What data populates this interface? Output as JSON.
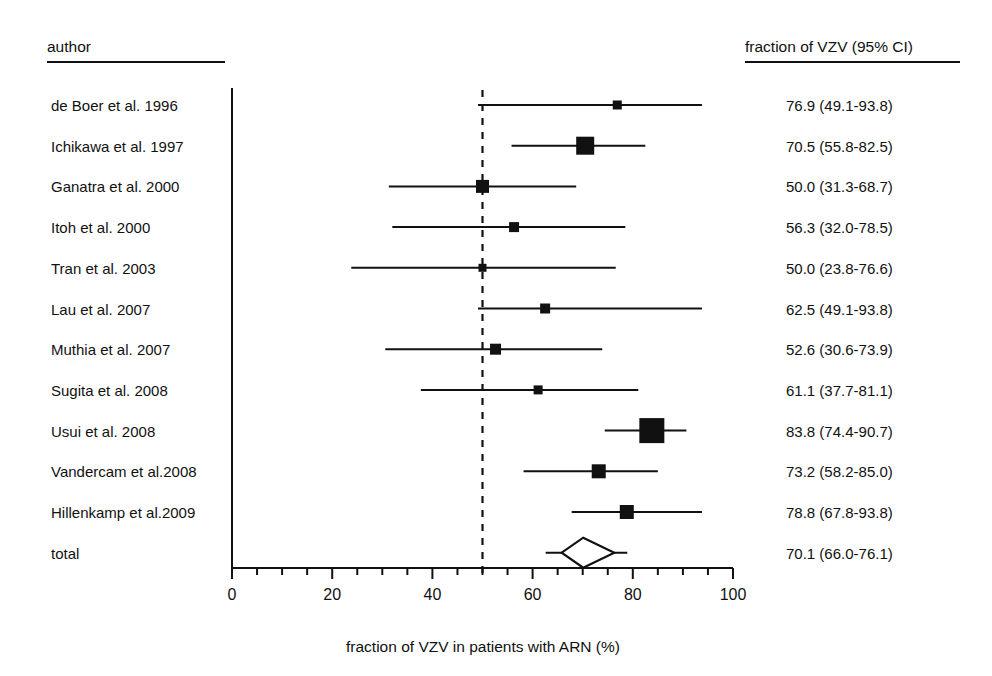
{
  "headers": {
    "left": "author",
    "right": "fraction of VZV (95% CI)"
  },
  "axis_title": "fraction of VZV in patients with ARN (%)",
  "chart_data": {
    "type": "scatter",
    "subtype": "forest-plot",
    "title": "",
    "xlabel": "fraction of VZV in patients with ARN (%)",
    "ylabel": "",
    "xlim": [
      0,
      100
    ],
    "xticks": [
      0,
      20,
      40,
      60,
      80,
      100
    ],
    "xtick_labels": [
      "0",
      "20",
      "40",
      "60",
      "80",
      "100"
    ],
    "minor_tick_step": 5,
    "grid": false,
    "legend": "none",
    "reference_line": 50,
    "reference_line_style": "dashed",
    "effect_label": "fraction of VZV (95% CI)",
    "categories": [
      "de Boer et al. 1996",
      "Ichikawa et al. 1997",
      "Ganatra et al. 2000",
      "Itoh et al. 2000",
      "Tran et al. 2003",
      "Lau et al. 2007",
      "Muthia et al. 2007",
      "Sugita et al. 2008",
      "Usui et al. 2008",
      "Vandercam et al.2008",
      "Hillenkamp et al.2009"
    ],
    "studies": [
      {
        "label": "de Boer et al. 1996",
        "estimate": 76.9,
        "ci_low": 49.1,
        "ci_high": 93.8,
        "text": "76.9 (49.1-93.8)",
        "marker": 9,
        "type": "study"
      },
      {
        "label": "Ichikawa et al. 1997",
        "estimate": 70.5,
        "ci_low": 55.8,
        "ci_high": 82.5,
        "text": "70.5 (55.8-82.5)",
        "marker": 18,
        "type": "study"
      },
      {
        "label": "Ganatra et al. 2000",
        "estimate": 50.0,
        "ci_low": 31.3,
        "ci_high": 68.7,
        "text": "50.0 (31.3-68.7)",
        "marker": 13,
        "type": "study"
      },
      {
        "label": "Itoh et al. 2000",
        "estimate": 56.3,
        "ci_low": 32.0,
        "ci_high": 78.5,
        "text": "56.3 (32.0-78.5)",
        "marker": 10,
        "type": "study"
      },
      {
        "label": "Tran et al. 2003",
        "estimate": 50.0,
        "ci_low": 23.8,
        "ci_high": 76.6,
        "text": "50.0 (23.8-76.6)",
        "marker": 8,
        "type": "study"
      },
      {
        "label": "Lau et al. 2007",
        "estimate": 62.5,
        "ci_low": 49.1,
        "ci_high": 93.8,
        "text": "62.5 (49.1-93.8)",
        "marker": 10,
        "type": "study"
      },
      {
        "label": "Muthia et al. 2007",
        "estimate": 52.6,
        "ci_low": 30.6,
        "ci_high": 73.9,
        "text": "52.6 (30.6-73.9)",
        "marker": 11,
        "type": "study"
      },
      {
        "label": "Sugita et al. 2008",
        "estimate": 61.1,
        "ci_low": 37.7,
        "ci_high": 81.1,
        "text": "61.1 (37.7-81.1)",
        "marker": 9,
        "type": "study"
      },
      {
        "label": "Usui et al. 2008",
        "estimate": 83.8,
        "ci_low": 74.4,
        "ci_high": 90.7,
        "text": "83.8 (74.4-90.7)",
        "marker": 25,
        "type": "study"
      },
      {
        "label": "Vandercam et al.2008",
        "estimate": 73.2,
        "ci_low": 58.2,
        "ci_high": 85.0,
        "text": "73.2 (58.2-85.0)",
        "marker": 14,
        "type": "study"
      },
      {
        "label": "Hillenkamp et al.2009",
        "estimate": 78.8,
        "ci_low": 67.8,
        "ci_high": 93.8,
        "text": "78.8 (67.8-93.8)",
        "marker": 14,
        "type": "study"
      }
    ],
    "summary": {
      "label": "total",
      "estimate": 70.1,
      "ci_low": 66.0,
      "ci_high": 76.1,
      "text": "70.1 (66.0-76.1)",
      "type": "summary",
      "marker": "diamond"
    }
  },
  "colors": {
    "ink": "#111111",
    "background": "#ffffff"
  }
}
